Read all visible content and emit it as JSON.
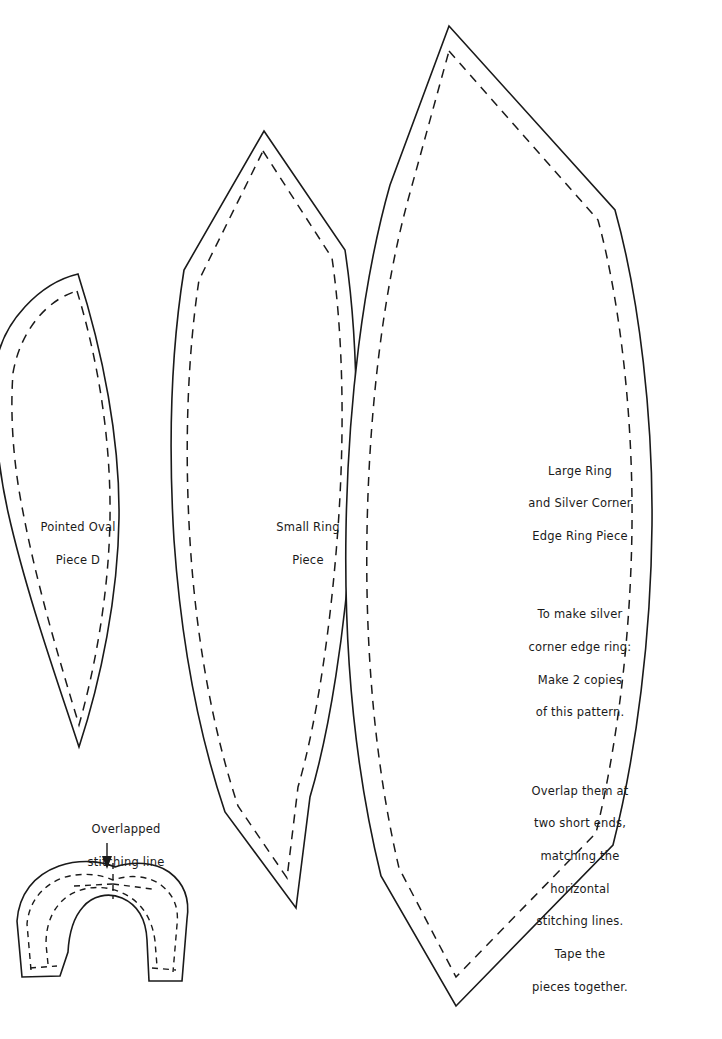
{
  "sheet": {
    "title": "Sewing Pattern Sheet",
    "background_color": "#ffffff",
    "ink_color": "#1a1a1a",
    "width": 722,
    "height": 1039
  },
  "pieces": {
    "pointed_oval": {
      "name": "pointed-oval-piece-d",
      "label_line_1": "Pointed Oval",
      "label_line_2": "Piece D"
    },
    "small_ring": {
      "name": "small-ring-piece",
      "label_line_1": "Small Ring",
      "label_line_2": "Piece"
    },
    "large_ring": {
      "name": "large-ring-piece",
      "paragraphs": [
        [
          "Large Ring",
          "and Silver Corner",
          "Edge Ring Piece"
        ],
        [
          "To make silver",
          "corner edge ring:",
          "Make 2 copies",
          "of this pattern."
        ],
        [
          "Overlap them at",
          "two short ends,",
          "matching the",
          "horizontal",
          "stitching lines.",
          "Tape the",
          "pieces together."
        ]
      ]
    },
    "overlap_arc": {
      "name": "overlapped-arc-piece",
      "annotation_line_1": "Overlapped",
      "annotation_line_2": "stitching line"
    }
  },
  "line_styles": {
    "cut_line": "solid",
    "stitch_line": "dashed"
  }
}
